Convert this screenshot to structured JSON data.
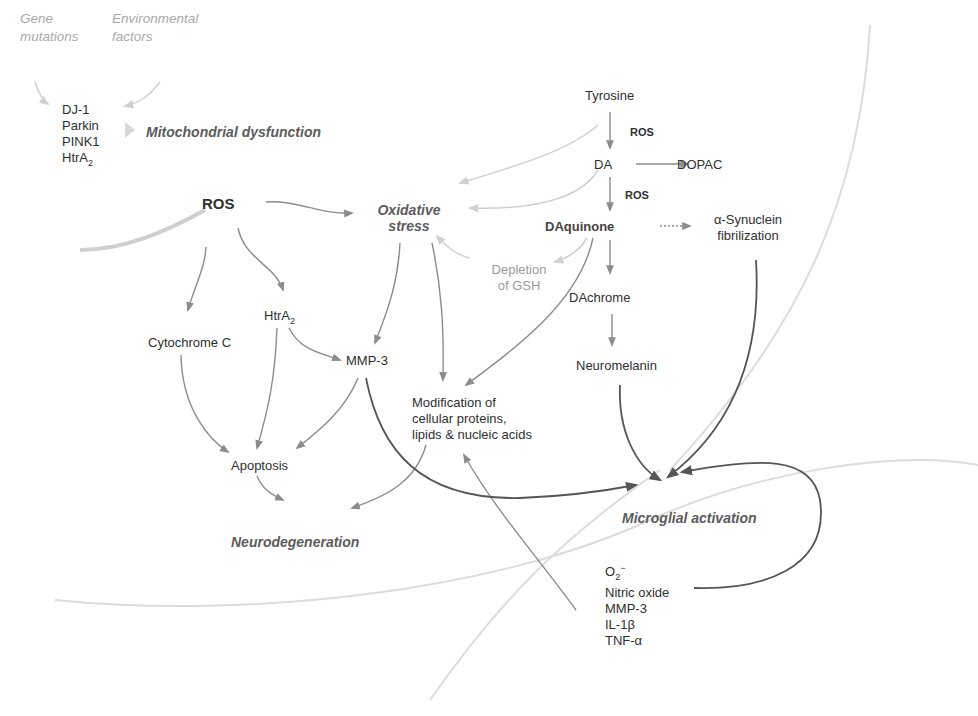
{
  "diagram": {
    "inputs": {
      "gene": [
        "Gene",
        "mutations"
      ],
      "environmental": [
        "Environmental",
        "factors"
      ]
    },
    "genes": [
      "DJ-1",
      "Parkin",
      "PINK1",
      "HtrA"
    ],
    "genes_sub": "2",
    "mitochondrial": "Mitochondrial dysfunction",
    "ros": "ROS",
    "oxidative_stress": [
      "Oxidative",
      "stress"
    ],
    "tyrosine_pathway": {
      "tyrosine": "Tyrosine",
      "ros_label_1": "ROS",
      "da": "DA",
      "dopac": "DOPAC",
      "ros_label_2": "ROS",
      "daquinone": "DAquinone",
      "synuclein": [
        "α-Synuclein",
        "fibrilization"
      ],
      "dachrome": "DAchrome",
      "neuromelanin": "Neuromelanin"
    },
    "depletion": [
      "Depletion",
      "of GSH"
    ],
    "htra2": "HtrA",
    "htra2_sub": "2",
    "cytochrome": "Cytochrome C",
    "mmp3": "MMP-3",
    "modification": [
      "Modification of",
      "cellular proteins,",
      "lipids & nucleic acids"
    ],
    "apoptosis": "Apoptosis",
    "neurodegeneration": "Neurodegeneration",
    "microglial": "Microglial activation",
    "microglial_products": {
      "o2": "O",
      "o2_sub": "2",
      "o2_sup": "−",
      "items": [
        "Nitric oxide",
        "MMP-3",
        "IL-1β",
        "TNF-α"
      ]
    },
    "colors": {
      "arrow": "#8c8c8c",
      "dark_arrow": "#555555",
      "faint_arrow": "#d6d6d6",
      "key_text": "#5c5c5c",
      "faint_text": "#a8a8a8"
    }
  }
}
